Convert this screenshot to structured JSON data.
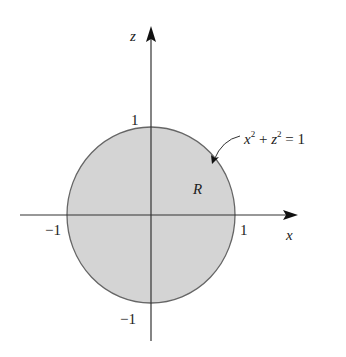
{
  "figure": {
    "axes": {
      "horizontal_label": "x",
      "vertical_label": "z"
    },
    "ticks": {
      "x_pos": "1",
      "x_neg": "−1",
      "z_pos": "1",
      "z_neg": "−1"
    },
    "region_label": "R",
    "equation": {
      "x": "x",
      "exp1": "2",
      "plus": " + ",
      "z": "z",
      "exp2": "2",
      "rest": " = 1"
    },
    "colors": {
      "fill": "#d4d4d4",
      "stroke": "#555555",
      "axis": "#333333"
    }
  }
}
